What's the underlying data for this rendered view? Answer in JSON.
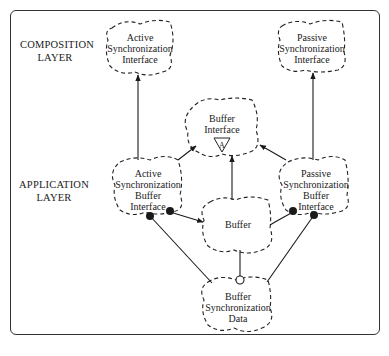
{
  "layers": [
    {
      "id": "composition",
      "lines": [
        "COMPOSITION",
        "LAYER"
      ]
    },
    {
      "id": "application",
      "lines": [
        "APPLICATION",
        "LAYER"
      ]
    }
  ],
  "nodes": {
    "active_sync_interface": {
      "lines": [
        "Active",
        "Synchronization",
        "Interface"
      ]
    },
    "passive_sync_interface": {
      "lines": [
        "Passive",
        "Synchronization",
        "Interface"
      ]
    },
    "buffer_interface": {
      "lines": [
        "Buffer",
        "Interface"
      ],
      "glyph": "A"
    },
    "active_sync_buffer_interface": {
      "lines": [
        "Active",
        "Synchronization",
        "Buffer",
        "Interface"
      ]
    },
    "passive_sync_buffer_interface": {
      "lines": [
        "Passive",
        "Synchronization",
        "Buffer",
        "Interface"
      ]
    },
    "buffer": {
      "lines": [
        "Buffer"
      ]
    },
    "buffer_sync_data": {
      "lines": [
        "Buffer",
        "Synchronization",
        "Data"
      ]
    }
  },
  "edges": [
    {
      "from": "active_sync_buffer_interface",
      "to": "active_sync_interface",
      "type": "arrow"
    },
    {
      "from": "passive_sync_buffer_interface",
      "to": "passive_sync_interface",
      "type": "arrow"
    },
    {
      "from": "active_sync_buffer_interface",
      "to": "buffer_interface",
      "type": "arrow"
    },
    {
      "from": "buffer",
      "to": "buffer_interface",
      "type": "arrow"
    },
    {
      "from": "passive_sync_buffer_interface",
      "to": "buffer_interface",
      "type": "arrow"
    },
    {
      "from": "active_sync_buffer_interface",
      "to": "buffer",
      "type": "filled-dot"
    },
    {
      "from": "passive_sync_buffer_interface",
      "to": "buffer",
      "type": "filled-dot"
    },
    {
      "from": "active_sync_buffer_interface",
      "to": "buffer_sync_data",
      "type": "filled-dot"
    },
    {
      "from": "passive_sync_buffer_interface",
      "to": "buffer_sync_data",
      "type": "filled-dot"
    },
    {
      "from": "buffer",
      "to": "buffer_sync_data",
      "type": "open-dot"
    }
  ]
}
